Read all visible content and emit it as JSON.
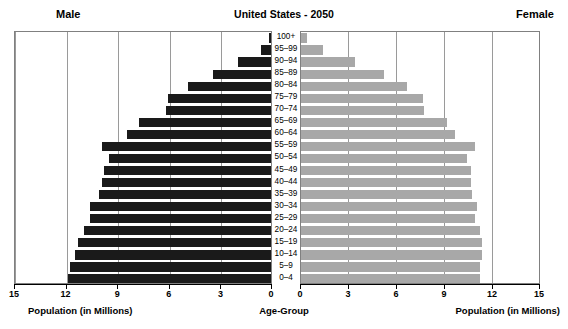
{
  "header": {
    "title": "United States - 2050",
    "male_label": "Male",
    "female_label": "Female"
  },
  "axes": {
    "male_caption": "Population (in Millions)",
    "center_caption": "Age-Group",
    "female_caption": "Population (in Millions)",
    "male_ticks": [
      "15",
      "12",
      "9",
      "6",
      "3",
      "0"
    ],
    "female_ticks": [
      "0",
      "3",
      "6",
      "9",
      "12",
      "15"
    ]
  },
  "chart_data": {
    "type": "bar",
    "title": "United States - 2050",
    "subtitle": "",
    "orientation": "horizontal-diverging",
    "xlabel": "Population (in Millions)",
    "ylabel": "Age-Group",
    "xlim": [
      0,
      15
    ],
    "grid": true,
    "legend_position": "outside-top-corners",
    "annotations": [
      "Male",
      "Female"
    ],
    "colors": {
      "male": "#1a1a1a",
      "female": "#a8a8a8",
      "gridline": "#9a9a9a",
      "frame": "#808080",
      "background": "#ffffff",
      "text": "#000000"
    },
    "categories": [
      "100+",
      "95–99",
      "90–94",
      "85–89",
      "80–84",
      "75–79",
      "70–74",
      "65–69",
      "60–64",
      "55–59",
      "50–54",
      "45–49",
      "40–44",
      "35–39",
      "30–34",
      "25–29",
      "20–24",
      "15–19",
      "10–14",
      "5–9",
      "0–4"
    ],
    "series": [
      {
        "name": "Male",
        "values": [
          0.1,
          0.6,
          1.9,
          3.4,
          4.8,
          6.0,
          6.1,
          7.7,
          8.4,
          9.8,
          9.4,
          9.7,
          9.8,
          10.0,
          10.5,
          10.5,
          10.9,
          11.2,
          11.4,
          11.7,
          11.8
        ]
      },
      {
        "name": "Female",
        "values": [
          0.35,
          1.4,
          3.4,
          5.2,
          6.6,
          7.6,
          7.7,
          9.1,
          9.6,
          10.9,
          10.4,
          10.6,
          10.6,
          10.7,
          11.0,
          10.9,
          11.2,
          11.3,
          11.3,
          11.2,
          11.2
        ]
      }
    ]
  }
}
